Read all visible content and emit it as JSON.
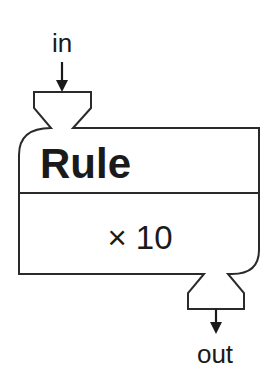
{
  "diagram": {
    "type": "block",
    "input": {
      "label": "in"
    },
    "output": {
      "label": "out"
    },
    "block": {
      "title": "Rule",
      "multiplier": "× 10"
    },
    "colors": {
      "stroke": "#2a2a2a",
      "text": "#1a1a1a",
      "background": "#ffffff"
    }
  }
}
